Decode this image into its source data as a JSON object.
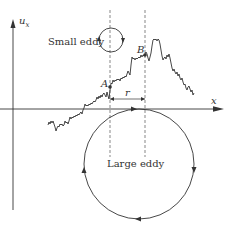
{
  "figure": {
    "axes": {
      "y_label": "u",
      "y_label_sub": "x",
      "x_label": "x"
    },
    "points": {
      "a_label": "A",
      "b_label": "B"
    },
    "separation_label": "r",
    "small_eddy_label": "Small eddy",
    "large_eddy_label": "Large eddy",
    "colors": {
      "stroke": "#333333",
      "dash": "#555555",
      "background": "#ffffff"
    }
  }
}
